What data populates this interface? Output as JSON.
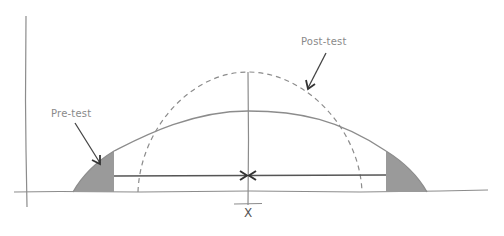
{
  "diagram": {
    "labels": {
      "pre_test": "Pre-test",
      "post_test": "Post-test",
      "x_axis_mark": "X"
    },
    "curves": [
      {
        "name": "Pre-test",
        "style": "solid",
        "description": "wide, flat bell curve with shaded tails"
      },
      {
        "name": "Post-test",
        "style": "dashed",
        "description": "narrow, tall bell curve"
      }
    ],
    "annotations": [
      {
        "type": "arrow",
        "from": "Pre-test label",
        "to": "left shaded tail"
      },
      {
        "type": "arrow",
        "from": "Post-test label",
        "to": "dashed curve"
      },
      {
        "type": "double-arrow",
        "description": "arrows from tails pointing inward to center mean X"
      }
    ],
    "colors": {
      "line": "#8c8c8c",
      "dark_line": "#444444",
      "shade": "#9a9a9a",
      "text": "#8a8a8a"
    }
  }
}
